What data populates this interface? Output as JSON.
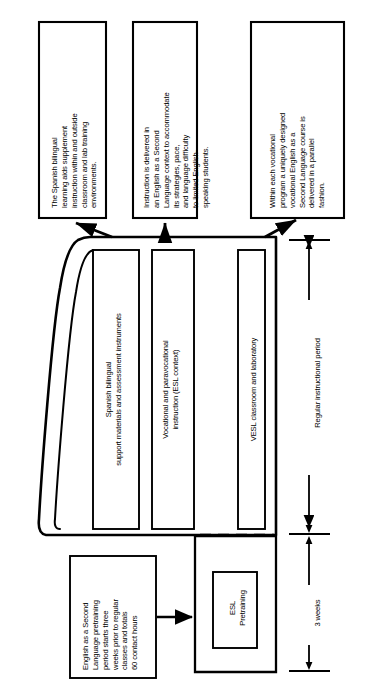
{
  "diagram": {
    "orientation": "rotated-90-ccw",
    "colors": {
      "stroke": "#000000",
      "background": "#ffffff"
    },
    "callouts": [
      {
        "id": "callout-learning-aids",
        "text": "The Spanish bilingual\nlearning aids supplement\ninstruction within and outside\nclassroom and lab training\nenvironments."
      },
      {
        "id": "callout-esl-context",
        "text": "Instruction is delivered in\nan English as a Second\nLanguage context to accommodate\nits strategies, pace,\nand language difficulty\nto limited English-\nspeaking students."
      },
      {
        "id": "callout-vesl-parallel",
        "text": "Within each vocational\nprogram a uniquely designed\nvocational English as a\nSecond Language course is\ndelivered in a parallel\nfashion."
      }
    ],
    "components": [
      {
        "id": "component-support-materials",
        "text": "Spanish bilingual\nsupport materials and assessment instruments"
      },
      {
        "id": "component-vocational-instruction",
        "text": "Vocational and paravocational\ninstruction (ESL context)"
      },
      {
        "id": "component-vesl-classroom",
        "text": "VESL classroom and laboratory"
      }
    ],
    "pretraining": {
      "id": "block-esl-pretraining",
      "text": "ESL\nPretraining",
      "note": "English as a Second\nLanguage pretraining\nperiod starts three\nweeks prior to regular\nclasses and totals\n60 contact hours"
    },
    "scales": [
      {
        "id": "scale-regular-instructional-period",
        "label": "Regular instructional period"
      },
      {
        "id": "scale-three-weeks",
        "label": "3 weeks"
      }
    ]
  }
}
